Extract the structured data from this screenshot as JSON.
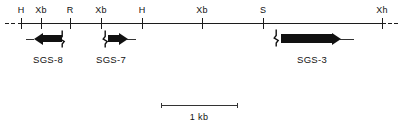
{
  "figure": {
    "type": "restriction-map",
    "width": 401,
    "height": 127,
    "background": "#ffffff",
    "line_color": "#1c1c1c"
  },
  "map": {
    "axis_y": 23,
    "axis_start_x": 18,
    "axis_end_x": 386,
    "left_dashes": [
      {
        "x": 5,
        "width": 4
      },
      {
        "x": 11,
        "width": 4
      }
    ],
    "right_dashes": [
      {
        "x": 388,
        "width": 4
      },
      {
        "x": 394,
        "width": 4
      }
    ],
    "sites": [
      {
        "label": "H",
        "x": 21,
        "name": "HindIII"
      },
      {
        "label": "Xb",
        "x": 41,
        "name": "XbaI"
      },
      {
        "label": "R",
        "x": 70,
        "name": "EcoRI"
      },
      {
        "label": "Xb",
        "x": 101,
        "name": "XbaI"
      },
      {
        "label": "H",
        "x": 142,
        "name": "HindIII"
      },
      {
        "label": "Xb",
        "x": 202,
        "name": "XbaI"
      },
      {
        "label": "S",
        "x": 263,
        "name": "SalI"
      },
      {
        "label": "Xh",
        "x": 382,
        "name": "XhoI"
      }
    ]
  },
  "genes": [
    {
      "id": "SGS-8",
      "label": "SGS-8",
      "direction": "left",
      "body_start_x": 34,
      "body_end_x": 62,
      "tail_start_x": 26,
      "tail_end_x": 34,
      "cap_x": 62,
      "label_x": 48,
      "label_y": 55,
      "body_y": 35,
      "body_height": 7
    },
    {
      "id": "SGS-7",
      "label": "SGS-7",
      "direction": "right",
      "body_start_x": 108,
      "body_end_x": 127,
      "tail_start_x": 127,
      "tail_end_x": 136,
      "cap_x": 105,
      "label_x": 111,
      "label_y": 55,
      "body_y": 35,
      "body_height": 7
    },
    {
      "id": "SGS-3",
      "label": "SGS-3",
      "direction": "right",
      "body_start_x": 281,
      "body_end_x": 340,
      "tail_start_x": 340,
      "tail_end_x": 354,
      "cap_x": 276,
      "label_x": 312,
      "label_y": 55,
      "body_y": 34,
      "body_height": 9
    }
  ],
  "scale_bar": {
    "label": "1 kb",
    "start_x": 161,
    "end_x": 237,
    "y": 105,
    "cap_height": 5,
    "label_x": 199,
    "label_y": 113
  }
}
